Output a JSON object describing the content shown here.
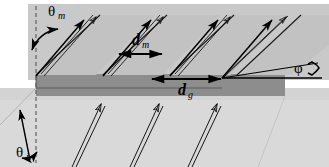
{
  "figure": {
    "width": 329,
    "height": 167,
    "background_color": "#ffffff"
  },
  "colors": {
    "upper_background": "#c9c9c9",
    "lower_background": "#d9d9d9",
    "facet_light": "#c2c2c2",
    "facet_dark": "#8d8d8d",
    "groove_white": "#ffffff",
    "line": "#000000",
    "dashed_guide": "#707070"
  },
  "labels": {
    "theta_m": {
      "symbol": "θ",
      "subscript": "m",
      "text": "θm",
      "x": 55,
      "y": 14,
      "description": "diffraction angle of order m from grating normal"
    },
    "theta_i": {
      "symbol": "θ",
      "subscript": "i",
      "text": "θi",
      "x": 22,
      "y": 156,
      "description": "angle of incidence from grating normal"
    },
    "d_m": {
      "symbol": "d",
      "subscript": "m",
      "text": "dm",
      "x": 140,
      "y": 45,
      "description": "path difference spacing for order m"
    },
    "d_g": {
      "symbol": "d",
      "subscript": "g",
      "text": "dg",
      "x": 188,
      "y": 93,
      "description": "groove spacing of the grating"
    },
    "phi": {
      "symbol": "φ",
      "subscript": "",
      "text": "φ",
      "x": 300,
      "y": 66,
      "description": "blaze angle of the facet"
    }
  },
  "dimension_arrows": [
    {
      "name": "d_m-measure",
      "x1": 118,
      "y1": 53,
      "x2": 163,
      "y2": 53,
      "double_headed": true
    },
    {
      "name": "d_g-measure",
      "x1": 151,
      "y1": 78,
      "x2": 222,
      "y2": 78,
      "double_headed": true
    }
  ],
  "angle_arcs": [
    {
      "name": "theta_m-arc",
      "cx": 36,
      "cy": 22,
      "radius": 36,
      "start_deg": -90,
      "end_deg": -36,
      "double_headed": true
    },
    {
      "name": "theta_i-arc",
      "cx": 36,
      "cy": 160,
      "radius": 18,
      "start_deg": 180,
      "end_deg": 118,
      "double_headed": true
    },
    {
      "name": "phi-arc",
      "cx": 222,
      "cy": 78,
      "radius": 86,
      "start_deg": 0,
      "end_deg": -9,
      "double_headed": true
    }
  ],
  "guides": [
    {
      "name": "grating-normal",
      "style": "dashed",
      "x1": 36,
      "y1": 6,
      "x2": 36,
      "y2": 163
    },
    {
      "name": "horizontal-reference",
      "style": "solid",
      "x1": 222,
      "y1": 78,
      "x2": 322,
      "y2": 78
    },
    {
      "name": "blaze-facet-extension",
      "style": "solid",
      "x1": 222,
      "y1": 78,
      "x2": 318,
      "y2": 64
    }
  ],
  "grating": {
    "type": "blazed-sawtooth",
    "facet_count": 4,
    "period_px": 67,
    "description": "Sawtooth blazed grating in perspective: light upper facet, dark riser face, white groove gaps"
  },
  "beams": {
    "incident": {
      "name": "incident-beam",
      "style": "outlined-double-line",
      "direction": "up-right",
      "count": 3,
      "description": "Incident rays arriving from lower left at angle theta_i"
    },
    "diffracted": {
      "name": "diffracted-beam",
      "style": "solid-and-outlined-pair",
      "direction": "up-right",
      "count": 4,
      "description": "Diffracted rays leaving at angle theta_m"
    }
  }
}
